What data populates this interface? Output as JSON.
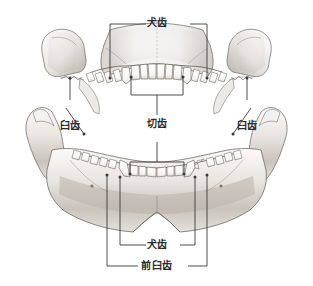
{
  "figure": {
    "kind": "anatomical-illustration",
    "background_color": "#ffffff",
    "line_color": "#3a3a3a",
    "bone_fill": "#f2f0ee",
    "bone_shadow": "#b9b4ae",
    "label_color": "#2b2b2b",
    "width": 313,
    "height": 286
  },
  "labels": {
    "upper_canine": "犬齿",
    "incisor": "切齿",
    "molar_left": "臼齿",
    "molar_right": "臼齿",
    "lower_canine": "犬齿",
    "premolar": "前臼齿"
  }
}
